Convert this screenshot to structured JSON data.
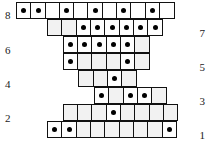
{
  "figure": {
    "type": "grid-dot-diagram",
    "cell_size_px": 15.6,
    "row_height_px": 17,
    "grid_origin_x_px": 16,
    "grid_origin_y_px": 2
  },
  "row_labels": {
    "left": [
      {
        "text": "8",
        "row": 8,
        "x": 5,
        "y": 10
      },
      {
        "text": "6",
        "row": 6,
        "x": 5,
        "y": 45
      },
      {
        "text": "4",
        "row": 4,
        "x": 5,
        "y": 79
      },
      {
        "text": "2",
        "row": 2,
        "x": 5,
        "y": 113
      }
    ],
    "right": [
      {
        "text": "7",
        "row": 7,
        "y": 28
      },
      {
        "text": "5",
        "row": 5,
        "y": 62
      },
      {
        "text": "3",
        "row": 3,
        "y": 96
      },
      {
        "text": "1",
        "row": 1,
        "y": 130
      }
    ]
  },
  "rows": [
    {
      "id": "row-8",
      "label": "8",
      "y_px": 2,
      "offset_cells": 0,
      "cell_count": 11,
      "dots": [
        1,
        2,
        4,
        6,
        8,
        10
      ],
      "shaded": []
    },
    {
      "id": "row-7",
      "label": "7",
      "y_px": 19,
      "offset_cells": 2,
      "cell_count": 8,
      "dots": [
        3,
        4,
        5,
        6,
        7,
        8
      ],
      "shaded": [
        1,
        2
      ]
    },
    {
      "id": "row-6",
      "label": "6",
      "y_px": 36,
      "offset_cells": 3,
      "cell_count": 6,
      "dots": [
        1,
        2,
        3,
        4,
        5
      ],
      "shaded": [
        6
      ]
    },
    {
      "id": "row-5",
      "label": "5",
      "y_px": 53,
      "offset_cells": 3,
      "cell_count": 6,
      "dots": [
        1,
        5
      ],
      "shaded": [
        2,
        3,
        4,
        6
      ]
    },
    {
      "id": "row-4",
      "label": "4",
      "y_px": 70,
      "offset_cells": 4,
      "cell_count": 4,
      "dots": [
        3
      ],
      "shaded": [
        1,
        2,
        4
      ]
    },
    {
      "id": "row-3",
      "label": "3",
      "y_px": 87,
      "offset_cells": 5,
      "cell_count": 5,
      "dots": [
        1,
        3,
        4
      ],
      "shaded": [
        2,
        5
      ]
    },
    {
      "id": "row-2",
      "label": "2",
      "y_px": 104,
      "offset_cells": 3,
      "cell_count": 8,
      "dots": [
        4
      ],
      "shaded": [
        1,
        2,
        3,
        5,
        6,
        7,
        8
      ]
    },
    {
      "id": "row-1",
      "label": "1",
      "y_px": 121,
      "offset_cells": 2,
      "cell_count": 9,
      "dots": [
        1,
        2,
        9
      ],
      "shaded": [
        3,
        4,
        5,
        6,
        7,
        8
      ]
    }
  ],
  "colors": {
    "cell_border": "#111111",
    "cell_fill": "#fefefe",
    "cell_fill_shaded": "#f2f2f2",
    "dot": "#000000",
    "label_text": "#1a1a1a",
    "background": "#ffffff"
  }
}
